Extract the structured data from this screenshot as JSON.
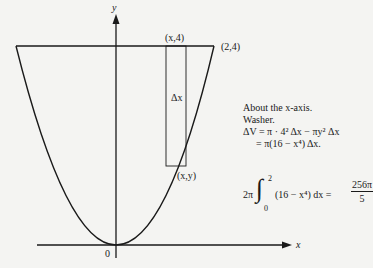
{
  "figure": {
    "axis_labels": {
      "x": "x",
      "y": "y",
      "origin": "0"
    },
    "points": {
      "top_strip": "(x,4)",
      "corner": "(2,4)",
      "curve_point": "(x,y)"
    },
    "strip_label": "Δx",
    "curve": "y = x^2",
    "colors": {
      "ink": "#1a1a1a",
      "background": "#f4f4f2"
    }
  },
  "notes": {
    "line1": "About the x-axis.",
    "line2": "Washer.",
    "line3": "ΔV = π · 4² Δx − πy² Δx",
    "line4": "= π(16 − x⁴) Δx."
  },
  "integral": {
    "coef": "2π",
    "upper": "2",
    "lower": "0",
    "integrand": "(16 − x⁴) dx =",
    "result_num": "256π",
    "result_den": "5"
  }
}
